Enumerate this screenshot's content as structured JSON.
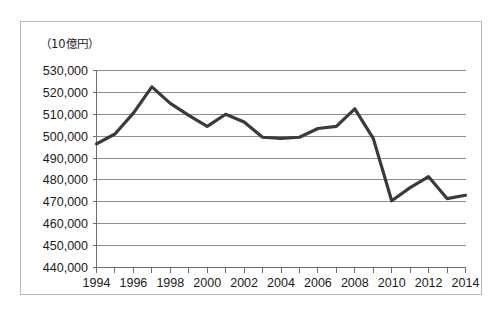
{
  "chart_data": {
    "type": "line",
    "title": "",
    "subtitle": "",
    "unit_label": "（10億円）",
    "xlabel": "",
    "ylabel": "",
    "grid": true,
    "grid_axis": "y",
    "legend": false,
    "legend_position": "none",
    "line_color": "#3a3a3a",
    "grid_color": "#8e8e8e",
    "axis_color": "#6e6e6e",
    "background_color": "#ffffff",
    "xlim": [
      1994,
      2014
    ],
    "ylim": [
      440000,
      530000
    ],
    "y_tick_step": 10000,
    "x_tick_step": 1,
    "x_label_step": 2,
    "x": [
      1994,
      1995,
      1996,
      1997,
      1998,
      1999,
      2000,
      2001,
      2002,
      2003,
      2004,
      2005,
      2006,
      2007,
      2008,
      2009,
      2010,
      2011,
      2012,
      2013,
      2014
    ],
    "values": [
      496500,
      501000,
      510500,
      522500,
      515000,
      509500,
      504500,
      510000,
      506500,
      499500,
      499000,
      499500,
      503500,
      504500,
      512500,
      499000,
      470500,
      476500,
      481500,
      471500,
      473000
    ],
    "series": [
      {
        "name": "",
        "values": [
          496500,
          501000,
          510500,
          522500,
          515000,
          509500,
          504500,
          510000,
          506500,
          499500,
          499000,
          499500,
          503500,
          504500,
          512500,
          499000,
          470500,
          476500,
          481500,
          471500,
          473000
        ]
      }
    ],
    "y_tick_labels": [
      "530,000",
      "520,000",
      "510,000",
      "500,000",
      "490,000",
      "480,000",
      "470,000",
      "460,000",
      "450,000",
      "440,000"
    ],
    "y_tick_values": [
      530000,
      520000,
      510000,
      500000,
      490000,
      480000,
      470000,
      460000,
      450000,
      440000
    ],
    "x_tick_labels": [
      "1994",
      "1996",
      "1998",
      "2000",
      "2002",
      "2004",
      "2006",
      "2008",
      "2010",
      "2012",
      "2014"
    ],
    "x_tick_values": [
      1994,
      1996,
      1998,
      2000,
      2002,
      2004,
      2006,
      2008,
      2010,
      2012,
      2014
    ],
    "annotations": []
  }
}
